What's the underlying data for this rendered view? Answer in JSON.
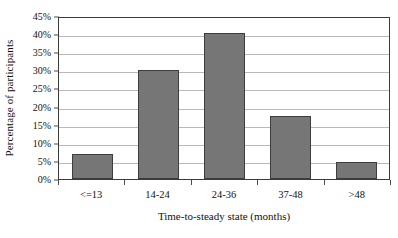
{
  "chart_data": {
    "type": "bar",
    "title": "",
    "subtitle": "",
    "xlabel": "Time-to-steady state (months)",
    "ylabel": "Percentage of participants",
    "categories": [
      "<=13",
      "14-24",
      "24-36",
      "37-48",
      ">48"
    ],
    "values": [
      6.8,
      30.0,
      40.3,
      17.3,
      4.8
    ],
    "series": [
      {
        "name": "Percentage of participants",
        "values": [
          6.8,
          30.0,
          40.3,
          17.3,
          4.8
        ]
      }
    ],
    "ylim": [
      0,
      45
    ],
    "ytick_values": [
      0,
      5,
      10,
      15,
      20,
      25,
      30,
      35,
      40,
      45
    ],
    "ytick_labels": [
      "0%",
      "5%",
      "10%",
      "15%",
      "20%",
      "25%",
      "30%",
      "35%",
      "40%",
      "45%"
    ],
    "grid": true,
    "grid_axis": "y",
    "legend": false,
    "legend_position": "none",
    "bar_color": "#767676",
    "bar_edge_color": "#3d3d3d",
    "gridline_color": "#b9b9b9",
    "axis_color": "#3b3b3b",
    "background_color": "#ffffff"
  }
}
